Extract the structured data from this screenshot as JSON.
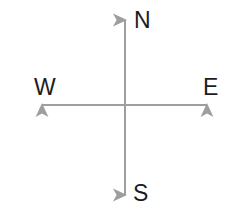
{
  "figure": {
    "name": "compass-directions",
    "background_color": "#ffffff",
    "width": 228,
    "height": 216
  },
  "axes": {
    "line_color": "#9e9e9e",
    "line_width": 2,
    "center": {
      "x": 125,
      "y": 105
    },
    "vertical": {
      "x": 125,
      "y_top": 13,
      "y_bottom": 202
    },
    "horizontal": {
      "y": 105,
      "x_left": 35,
      "x_right": 214
    },
    "arrowheads": [
      "north",
      "south",
      "east",
      "west"
    ]
  },
  "labels": {
    "text_color": "#1c1c1c",
    "north": "N",
    "west": "W",
    "east": "E",
    "south": "S"
  },
  "chart_data": {
    "type": "diagram",
    "categories": [
      "N",
      "E",
      "S",
      "W"
    ],
    "points": [
      {
        "label": "N",
        "direction": "north",
        "angle_deg": 90,
        "tip": {
          "x": 125,
          "y": 13
        },
        "label_pos": {
          "x": 142,
          "y": 20
        }
      },
      {
        "label": "E",
        "direction": "east",
        "angle_deg": 0,
        "tip": {
          "x": 214,
          "y": 105
        },
        "label_pos": {
          "x": 210,
          "y": 87
        }
      },
      {
        "label": "S",
        "direction": "south",
        "angle_deg": 270,
        "tip": {
          "x": 125,
          "y": 202
        },
        "label_pos": {
          "x": 141,
          "y": 193
        }
      },
      {
        "label": "W",
        "direction": "west",
        "angle_deg": 180,
        "tip": {
          "x": 35,
          "y": 105
        },
        "label_pos": {
          "x": 42,
          "y": 87
        }
      }
    ],
    "grid": false,
    "legend": false
  }
}
